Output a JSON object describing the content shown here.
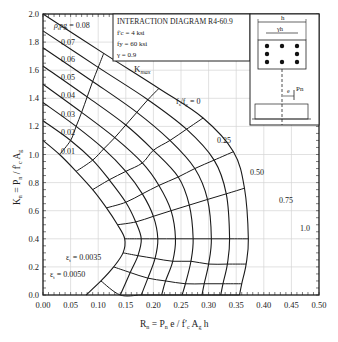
{
  "chart_data": {
    "type": "line",
    "title": "INTERACTION DIAGRAM R4-60.9",
    "parameters": [
      "f'c = 4 ksi",
      "fy = 60 ksi",
      "γ = 0.9"
    ],
    "xlabel": "Rn = Pn e / f'c Ag h",
    "ylabel": "Kn = Pn / f'c Ag",
    "xlim": [
      0,
      0.5
    ],
    "ylim": [
      0,
      2.0
    ],
    "xticks": [
      "0.00",
      "0.05",
      "0.10",
      "0.15",
      "0.20",
      "0.25",
      "0.30",
      "0.35",
      "0.40",
      "0.45",
      "0.50"
    ],
    "yticks": [
      "0.0",
      "0.2",
      "0.4",
      "0.6",
      "0.8",
      "1.0",
      "1.2",
      "1.4",
      "1.6",
      "1.8",
      "2.0"
    ],
    "grid": true,
    "series": [
      {
        "name": "ρg = 0.01",
        "points": [
          [
            0,
            1.1
          ],
          [
            0.03,
            1.0
          ],
          [
            0.06,
            0.88
          ],
          [
            0.09,
            0.75
          ],
          [
            0.115,
            0.62
          ],
          [
            0.135,
            0.5
          ],
          [
            0.148,
            0.4
          ],
          [
            0.145,
            0.3
          ],
          [
            0.128,
            0.2
          ],
          [
            0.105,
            0.1
          ],
          [
            0.078,
            0.0
          ]
        ]
      },
      {
        "name": "ρg = 0.02",
        "points": [
          [
            0,
            1.24
          ],
          [
            0.05,
            1.1
          ],
          [
            0.09,
            0.96
          ],
          [
            0.12,
            0.82
          ],
          [
            0.15,
            0.66
          ],
          [
            0.168,
            0.52
          ],
          [
            0.178,
            0.4
          ],
          [
            0.172,
            0.28
          ],
          [
            0.158,
            0.16
          ],
          [
            0.14,
            0.0
          ]
        ]
      },
      {
        "name": "ρg = 0.03",
        "points": [
          [
            0,
            1.37
          ],
          [
            0.06,
            1.2
          ],
          [
            0.11,
            1.04
          ],
          [
            0.15,
            0.88
          ],
          [
            0.18,
            0.72
          ],
          [
            0.2,
            0.56
          ],
          [
            0.208,
            0.4
          ],
          [
            0.203,
            0.26
          ],
          [
            0.19,
            0.12
          ],
          [
            0.178,
            0.0
          ]
        ]
      },
      {
        "name": "ρg = 0.04",
        "points": [
          [
            0,
            1.5
          ],
          [
            0.07,
            1.3
          ],
          [
            0.13,
            1.12
          ],
          [
            0.18,
            0.94
          ],
          [
            0.21,
            0.78
          ],
          [
            0.232,
            0.6
          ],
          [
            0.24,
            0.4
          ],
          [
            0.235,
            0.24
          ],
          [
            0.222,
            0.1
          ],
          [
            0.215,
            0.0
          ]
        ]
      },
      {
        "name": "ρg = 0.05",
        "points": [
          [
            0,
            1.63
          ],
          [
            0.08,
            1.41
          ],
          [
            0.15,
            1.21
          ],
          [
            0.2,
            1.03
          ],
          [
            0.245,
            0.84
          ],
          [
            0.265,
            0.64
          ],
          [
            0.272,
            0.4
          ],
          [
            0.268,
            0.24
          ],
          [
            0.258,
            0.08
          ],
          [
            0.252,
            0.0
          ]
        ]
      },
      {
        "name": "ρg = 0.06",
        "points": [
          [
            0,
            1.76
          ],
          [
            0.09,
            1.52
          ],
          [
            0.17,
            1.3
          ],
          [
            0.23,
            1.1
          ],
          [
            0.275,
            0.9
          ],
          [
            0.298,
            0.68
          ],
          [
            0.305,
            0.4
          ],
          [
            0.3,
            0.22
          ],
          [
            0.292,
            0.08
          ],
          [
            0.288,
            0.0
          ]
        ]
      },
      {
        "name": "ρg = 0.07",
        "points": [
          [
            0,
            1.88
          ],
          [
            0.1,
            1.62
          ],
          [
            0.19,
            1.39
          ],
          [
            0.26,
            1.18
          ],
          [
            0.31,
            0.96
          ],
          [
            0.332,
            0.72
          ],
          [
            0.338,
            0.4
          ],
          [
            0.334,
            0.22
          ],
          [
            0.326,
            0.08
          ],
          [
            0.322,
            0.0
          ]
        ]
      },
      {
        "name": "ρg = 0.08",
        "points": [
          [
            0,
            2.0
          ],
          [
            0.11,
            1.72
          ],
          [
            0.21,
            1.47
          ],
          [
            0.29,
            1.26
          ],
          [
            0.345,
            1.02
          ],
          [
            0.365,
            0.76
          ],
          [
            0.372,
            0.4
          ],
          [
            0.368,
            0.22
          ],
          [
            0.36,
            0.08
          ],
          [
            0.356,
            0.0
          ]
        ]
      }
    ],
    "annotations": {
      "rho_labels": [
        "ρg = 0.08",
        "0.07",
        "0.06",
        "0.05",
        "0.04",
        "0.03",
        "0.02",
        "0.01"
      ],
      "kmax": "Kmax",
      "fs_labels": [
        "fs/fy = 0",
        "0.25",
        "0.50",
        "0.75",
        "1.0"
      ],
      "strain_labels": [
        "εt = 0.0035",
        "εt = 0.0050"
      ]
    }
  },
  "inset": {
    "dim_h": "h",
    "dim_gh": "γh",
    "e_label": "e",
    "p_label": "Pn"
  }
}
